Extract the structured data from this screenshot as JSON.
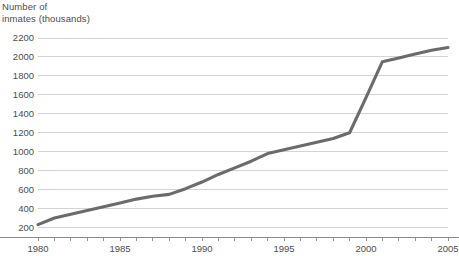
{
  "chart_data": {
    "type": "line",
    "title": "Number of\ninmates (thousands)",
    "xlabel": "",
    "ylabel": "Number of inmates (thousands)",
    "xlim": [
      1980,
      2005
    ],
    "ylim": [
      100,
      2200
    ],
    "grid": true,
    "legend": null,
    "line_color": "#6b6b6b",
    "grid_color": "#c8c8c8",
    "axis_color": "#8a8a8a",
    "y_ticks": [
      200,
      400,
      600,
      800,
      1000,
      1200,
      1400,
      1600,
      1800,
      2000,
      2200
    ],
    "y_tick_labels": [
      "200",
      "400",
      "600",
      "800",
      "1000",
      "1200",
      "1400",
      "1600",
      "1800",
      "2000",
      "2200"
    ],
    "x_ticks": [
      1980,
      1981,
      1982,
      1983,
      1984,
      1985,
      1986,
      1987,
      1988,
      1989,
      1990,
      1991,
      1992,
      1993,
      1994,
      1995,
      1996,
      1997,
      1998,
      1999,
      2000,
      2001,
      2002,
      2003,
      2004,
      2005
    ],
    "x_tick_labels": [
      "1980",
      "1985",
      "1990",
      "1995",
      "2000",
      "2005"
    ],
    "x_labeled_ticks": [
      1980,
      1985,
      1990,
      1995,
      2000,
      2005
    ],
    "x": [
      1980,
      1981,
      1982,
      1983,
      1984,
      1985,
      1986,
      1987,
      1988,
      1989,
      1990,
      1991,
      1992,
      1993,
      1994,
      1995,
      1996,
      1997,
      1998,
      1999,
      2000,
      2001,
      2002,
      2003,
      2004,
      2005
    ],
    "values": [
      230,
      300,
      340,
      380,
      420,
      460,
      500,
      530,
      550,
      610,
      680,
      760,
      830,
      900,
      980,
      1020,
      1060,
      1100,
      1140,
      1200,
      1570,
      1950,
      1990,
      2030,
      2070,
      2100
    ],
    "series": [
      {
        "name": "Number of inmates",
        "values": [
          230,
          300,
          340,
          380,
          420,
          460,
          500,
          530,
          550,
          610,
          680,
          760,
          830,
          900,
          980,
          1020,
          1060,
          1100,
          1140,
          1200,
          1570,
          1950,
          1990,
          2030,
          2070,
          2100
        ]
      }
    ]
  },
  "geometry": {
    "plot_left": 38,
    "plot_right": 448,
    "plot_top": 38,
    "plot_bottom": 237,
    "y_top_value": 2200,
    "y_bottom_value": 100,
    "x_axis_y": 237
  }
}
